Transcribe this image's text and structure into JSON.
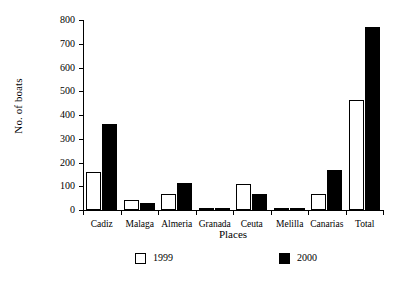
{
  "chart_data": {
    "type": "bar",
    "title": "",
    "xlabel": "Places",
    "ylabel": "No. of boats",
    "ylim": [
      0,
      800
    ],
    "yticks": [
      0,
      100,
      200,
      300,
      400,
      500,
      600,
      700,
      800
    ],
    "ytick_labels": [
      "0",
      "100",
      "200",
      "300",
      "400",
      "500",
      "600",
      "700",
      "800"
    ],
    "grid": false,
    "legend_position": "bottom",
    "categories": [
      "Cadiz",
      "Malaga",
      "Almeria",
      "Granada",
      "Ceuta",
      "Melilla",
      "Canarias",
      "Total"
    ],
    "series": [
      {
        "name": "1999",
        "color": "#ffffff",
        "edge_color": "#000000",
        "values": [
          161,
          41,
          68,
          4,
          108,
          4,
          68,
          464
        ]
      },
      {
        "name": "2000",
        "color": "#000000",
        "edge_color": "#000000",
        "values": [
          364,
          29,
          114,
          9,
          69,
          1,
          168,
          770
        ]
      }
    ],
    "legend_entries": [
      {
        "label": "1999",
        "swatch": "open"
      },
      {
        "label": "2000",
        "swatch": "filled"
      }
    ]
  }
}
